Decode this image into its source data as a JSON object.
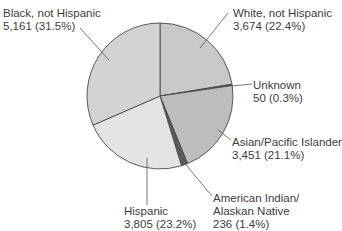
{
  "chart_data": {
    "type": "pie",
    "title": "",
    "start_angle_deg": 0,
    "direction": "clockwise",
    "slices": [
      {
        "label": "White, not Hispanic",
        "value": 3674,
        "percent": 22.4,
        "color": "#c8c8c8"
      },
      {
        "label": "Unknown",
        "value": 50,
        "percent": 0.3,
        "color": "#3c3c3c"
      },
      {
        "label": "Asian/Pacific Islander",
        "value": 3451,
        "percent": 21.1,
        "color": "#bdbdbd"
      },
      {
        "label": "American Indian/\nAlaskan Native",
        "value": 236,
        "percent": 1.4,
        "color": "#5a5a5a"
      },
      {
        "label": "Hispanic",
        "value": 3805,
        "percent": 23.2,
        "color": "#e3e3e3"
      },
      {
        "label": "Black, not Hispanic",
        "value": 5161,
        "percent": 31.5,
        "color": "#d2d2d2"
      }
    ]
  },
  "labels": {
    "white": {
      "name": "White, not Hispanic",
      "value": "3,674 (22.4%)"
    },
    "unknown": {
      "name": "Unknown",
      "value": "50 (0.3%)"
    },
    "asian": {
      "name": "Asian/Pacific Islander",
      "value": "3,451 (21.1%)"
    },
    "american_indian": {
      "name1": "American Indian/",
      "name2": "Alaskan Native",
      "value": "236 (1.4%)"
    },
    "hispanic": {
      "name": "Hispanic",
      "value": "3,805 (23.2%)"
    },
    "black": {
      "name": "Black, not Hispanic",
      "value": "5,161 (31.5%)"
    }
  }
}
